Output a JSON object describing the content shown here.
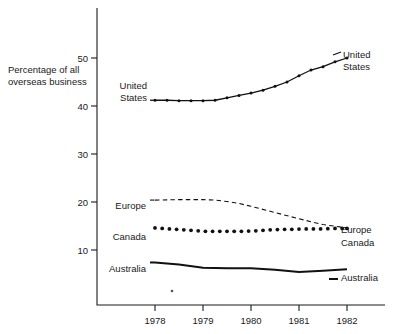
{
  "chart_data": {
    "type": "line",
    "title": "",
    "xlabel": "",
    "ylabel": "Percentage of all overseas business",
    "ylabel_line1": "Percentage of all",
    "ylabel_line2": "overseas business",
    "xlim": [
      1977.6,
      1982.2
    ],
    "ylim": [
      0,
      55
    ],
    "yticks": [
      10,
      20,
      30,
      40,
      50
    ],
    "ytick_labels": [
      "10",
      "20",
      "30",
      "40",
      "50"
    ],
    "xticks": [
      1978,
      1979,
      1980,
      1981,
      1982
    ],
    "xtick_labels": [
      "1978",
      "1979",
      "1980",
      "1981",
      "1982"
    ],
    "grid": false,
    "legend": "inline-end-labels",
    "series": [
      {
        "name": "United States",
        "label_left": "United States",
        "label_right": "United States",
        "style": "solid-with-markers",
        "x": [
          1978.0,
          1978.25,
          1978.5,
          1978.75,
          1979.0,
          1979.25,
          1979.5,
          1979.75,
          1980.0,
          1980.25,
          1980.5,
          1980.75,
          1981.0,
          1981.25,
          1981.5,
          1981.75,
          1982.0
        ],
        "values": [
          41.2,
          41.2,
          41.1,
          41.1,
          41.1,
          41.2,
          41.7,
          42.2,
          42.7,
          43.3,
          44.1,
          45.0,
          46.3,
          47.5,
          48.2,
          49.2,
          50.0
        ]
      },
      {
        "name": "Europe",
        "label_left": "Europe",
        "label_right": "Europe",
        "style": "dashed",
        "x": [
          1978.0,
          1978.5,
          1979.0,
          1979.25,
          1979.5,
          1979.75,
          1980.0,
          1980.5,
          1981.0,
          1981.5,
          1982.0
        ],
        "values": [
          20.4,
          20.5,
          20.5,
          20.4,
          20.1,
          19.7,
          19.1,
          17.8,
          16.5,
          15.3,
          14.6
        ]
      },
      {
        "name": "Canada",
        "label_left": "Canada",
        "label_right": "Canada",
        "style": "dotted",
        "x": [
          1978.0,
          1978.15,
          1978.3,
          1978.45,
          1978.6,
          1978.75,
          1978.9,
          1979.05,
          1979.2,
          1979.35,
          1979.5,
          1979.65,
          1979.8,
          1979.95,
          1980.1,
          1980.25,
          1980.4,
          1980.55,
          1980.7,
          1980.85,
          1981.0,
          1981.15,
          1981.3,
          1981.45,
          1981.6,
          1981.75,
          1981.9,
          1982.0
        ],
        "values": [
          14.6,
          14.5,
          14.4,
          14.3,
          14.2,
          14.1,
          14.0,
          13.9,
          13.9,
          13.9,
          13.9,
          13.9,
          13.9,
          13.95,
          14.0,
          14.1,
          14.2,
          14.25,
          14.3,
          14.3,
          14.35,
          14.4,
          14.4,
          14.4,
          14.45,
          14.5,
          14.5,
          14.5
        ]
      },
      {
        "name": "Australia",
        "label_left": "Australia",
        "label_right": "Australia",
        "style": "solid-thick",
        "x": [
          1978.0,
          1978.5,
          1979.0,
          1979.5,
          1980.0,
          1980.5,
          1981.0,
          1981.5,
          1982.0
        ],
        "values": [
          7.4,
          7.0,
          6.3,
          6.2,
          6.2,
          5.9,
          5.4,
          5.7,
          6.0
        ]
      }
    ]
  },
  "axis": {
    "y_title_line1": "Percentage of all",
    "y_title_line2": "overseas business"
  }
}
